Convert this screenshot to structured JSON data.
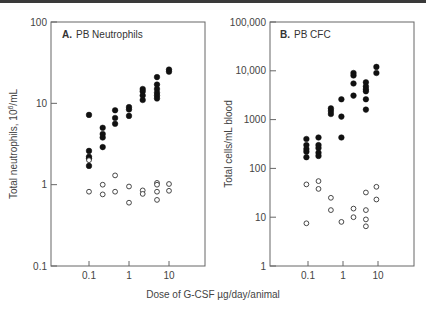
{
  "chart_data": [
    {
      "type": "scatter",
      "title": "A. PB Neutrophils",
      "panel_letter": "A.",
      "panel_name": "PB Neutrophils",
      "xlabel": "Dose of G-CSF µg/day/animal",
      "ylabel": "Total neutrophils, 10^6/mL",
      "xscale": "log",
      "yscale": "log",
      "xlim": [
        0.012,
        80
      ],
      "ylim": [
        0.1,
        100
      ],
      "xticks": [
        "0.1",
        "1",
        "10"
      ],
      "yticks": [
        "0.1",
        "1",
        "10",
        "100"
      ],
      "grid": false,
      "series": [
        {
          "name": "Filled (treated)",
          "marker": "filled-circle",
          "points": [
            [
              0.1,
              7.2
            ],
            [
              0.1,
              2.6
            ],
            [
              0.1,
              2.2
            ],
            [
              0.1,
              2.1
            ],
            [
              0.1,
              1.7
            ],
            [
              0.22,
              5.0
            ],
            [
              0.22,
              4.2
            ],
            [
              0.22,
              3.8
            ],
            [
              0.22,
              2.9
            ],
            [
              0.45,
              8.2
            ],
            [
              0.45,
              6.6
            ],
            [
              0.45,
              5.6
            ],
            [
              1.0,
              9.0
            ],
            [
              1.0,
              8.4
            ],
            [
              1.0,
              7.0
            ],
            [
              2.2,
              15.0
            ],
            [
              2.2,
              14.0
            ],
            [
              2.2,
              12.5
            ],
            [
              2.2,
              11.0
            ],
            [
              5.0,
              21.0
            ],
            [
              5.0,
              17.0
            ],
            [
              5.0,
              15.0
            ],
            [
              5.0,
              13.5
            ],
            [
              5.0,
              12.5
            ],
            [
              5.0,
              11.5
            ],
            [
              10.0,
              26.0
            ],
            [
              10.0,
              24.5
            ]
          ]
        },
        {
          "name": "Open (control)",
          "marker": "open-circle",
          "points": [
            [
              0.1,
              2.0
            ],
            [
              0.1,
              0.82
            ],
            [
              0.22,
              1.0
            ],
            [
              0.22,
              0.76
            ],
            [
              0.45,
              1.3
            ],
            [
              0.45,
              0.82
            ],
            [
              1.0,
              0.95
            ],
            [
              1.0,
              0.6
            ],
            [
              2.2,
              0.85
            ],
            [
              2.2,
              0.77
            ],
            [
              5.0,
              1.05
            ],
            [
              5.0,
              1.0
            ],
            [
              5.0,
              0.82
            ],
            [
              5.0,
              0.65
            ],
            [
              10.0,
              1.02
            ],
            [
              10.0,
              0.84
            ]
          ]
        }
      ]
    },
    {
      "type": "scatter",
      "title": "B. PB CFC",
      "panel_letter": "B.",
      "panel_name": "PB CFC",
      "xlabel": "Dose of G-CSF µg/day/animal",
      "ylabel": "Total cells/mL blood",
      "xscale": "log",
      "yscale": "log",
      "xlim": [
        0.012,
        80
      ],
      "ylim": [
        1,
        100000
      ],
      "xticks": [
        "0.1",
        "1",
        "10"
      ],
      "yticks": [
        "1",
        "10",
        "100",
        "1000",
        "10,000",
        "100,000"
      ],
      "grid": false,
      "series": [
        {
          "name": "Filled (treated)",
          "marker": "filled-circle",
          "points": [
            [
              0.09,
              400
            ],
            [
              0.09,
              300
            ],
            [
              0.09,
              250
            ],
            [
              0.09,
              220
            ],
            [
              0.09,
              170
            ],
            [
              0.2,
              430
            ],
            [
              0.2,
              300
            ],
            [
              0.2,
              260
            ],
            [
              0.2,
              210
            ],
            [
              0.2,
              180
            ],
            [
              0.45,
              1700
            ],
            [
              0.45,
              1500
            ],
            [
              0.45,
              1300
            ],
            [
              0.9,
              2600
            ],
            [
              0.9,
              1150
            ],
            [
              0.9,
              430
            ],
            [
              2.0,
              9000
            ],
            [
              2.0,
              8000
            ],
            [
              2.0,
              5500
            ],
            [
              2.0,
              3100
            ],
            [
              4.5,
              5800
            ],
            [
              4.5,
              4800
            ],
            [
              4.5,
              4200
            ],
            [
              4.5,
              3800
            ],
            [
              4.5,
              2600
            ],
            [
              4.5,
              1600
            ],
            [
              9.0,
              12000
            ],
            [
              9.0,
              9000
            ]
          ]
        },
        {
          "name": "Open (control)",
          "marker": "open-circle",
          "points": [
            [
              0.09,
              47
            ],
            [
              0.09,
              7.5
            ],
            [
              0.2,
              55
            ],
            [
              0.2,
              38
            ],
            [
              0.45,
              25
            ],
            [
              0.45,
              14
            ],
            [
              0.9,
              8
            ],
            [
              2.0,
              15
            ],
            [
              2.0,
              10
            ],
            [
              4.5,
              32
            ],
            [
              4.5,
              14
            ],
            [
              4.5,
              9
            ],
            [
              4.5,
              6.5
            ],
            [
              9.0,
              42
            ],
            [
              9.0,
              23
            ]
          ]
        }
      ]
    }
  ],
  "labels": {
    "panel_a_letter": "A.",
    "panel_a_name": "PB Neutrophils",
    "panel_a_ylabel_main": "Total neutrophils, 10",
    "panel_a_ylabel_sup": "6",
    "panel_a_ylabel_tail": "/mL",
    "panel_b_letter": "B.",
    "panel_b_name": "PB CFC",
    "panel_b_ylabel": "Total cells/mL blood",
    "shared_xlabel": "Dose of G-CSF µg/day/animal",
    "a_yticks": [
      "100",
      "10",
      "1",
      "0.1"
    ],
    "b_yticks": [
      "100,000",
      "10,000",
      "1000",
      "100",
      "10",
      "1"
    ],
    "xticks": [
      "0.1",
      "1",
      "10"
    ]
  }
}
